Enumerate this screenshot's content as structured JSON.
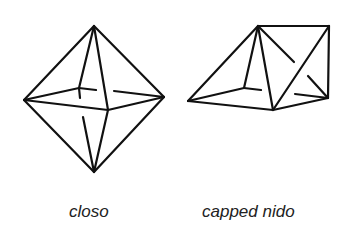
{
  "figure": {
    "panels": [
      {
        "id": "closo",
        "label": "closo",
        "shape": "octahedron"
      },
      {
        "id": "capped-nido",
        "label": "capped nido",
        "shape": "capped square pyramid"
      }
    ]
  },
  "colors": {
    "background": "#ffffff",
    "stroke": "#111111",
    "text": "#222222"
  }
}
